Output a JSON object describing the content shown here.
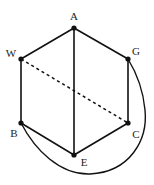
{
  "diagram": {
    "type": "graph",
    "nodes": [
      {
        "id": "A",
        "label": "A",
        "x": 74,
        "y": 28,
        "lx": 74,
        "ly": 20
      },
      {
        "id": "W",
        "label": "W",
        "x": 21,
        "y": 59,
        "lx": 11,
        "ly": 57
      },
      {
        "id": "G",
        "label": "G",
        "x": 128,
        "y": 59,
        "lx": 136,
        "ly": 55
      },
      {
        "id": "B",
        "label": "B",
        "x": 21,
        "y": 123,
        "lx": 14,
        "ly": 137
      },
      {
        "id": "C",
        "label": "C",
        "x": 128,
        "y": 123,
        "lx": 136,
        "ly": 138
      },
      {
        "id": "E",
        "label": "E",
        "x": 74,
        "y": 155,
        "lx": 84,
        "ly": 166
      }
    ],
    "edges": [
      {
        "from": "A",
        "to": "W",
        "style": "solid"
      },
      {
        "from": "A",
        "to": "G",
        "style": "solid"
      },
      {
        "from": "W",
        "to": "B",
        "style": "solid"
      },
      {
        "from": "G",
        "to": "C",
        "style": "solid"
      },
      {
        "from": "B",
        "to": "E",
        "style": "solid"
      },
      {
        "from": "C",
        "to": "E",
        "style": "solid"
      },
      {
        "from": "A",
        "to": "E",
        "style": "solid"
      },
      {
        "from": "W",
        "to": "C",
        "style": "dashed"
      },
      {
        "from": "B",
        "to": "G",
        "style": "solid",
        "curved": true
      }
    ],
    "colors": {
      "stroke": "#111111",
      "node": "#111111",
      "background": "#ffffff"
    }
  }
}
